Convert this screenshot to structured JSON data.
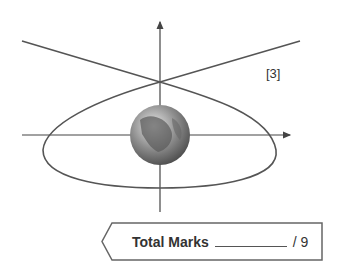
{
  "diagram": {
    "colors": {
      "line": "#555555",
      "axis": "#444444",
      "globe": "#7a7a7a"
    },
    "icons": {
      "globe": "earth-globe-icon"
    }
  },
  "question": {
    "marks_label": "[3]"
  },
  "footer": {
    "total_label": "Total Marks",
    "total_suffix": "/ 9"
  }
}
